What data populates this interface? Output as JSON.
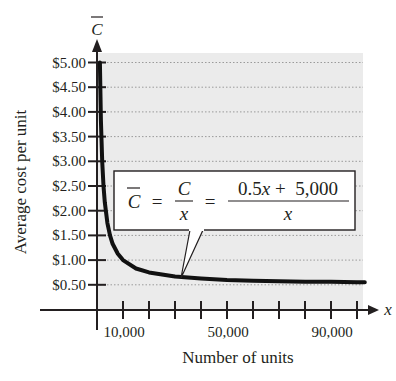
{
  "chart_data": {
    "type": "line",
    "title": "",
    "xlabel": "Number of units",
    "ylabel": "Average cost per unit",
    "x_axis_variable": "x",
    "y_axis_variable": "C̄",
    "xlim": [
      0,
      103000
    ],
    "ylim": [
      0,
      5.3
    ],
    "grid": {
      "horizontal_dotted": true,
      "vertical": false
    },
    "background_shading": "#ebebeb",
    "x_ticks": [
      10000,
      20000,
      30000,
      40000,
      50000,
      60000,
      70000,
      80000,
      90000,
      100000
    ],
    "x_tick_labels": [
      {
        "value": 10000,
        "label": "10,000"
      },
      {
        "value": 50000,
        "label": "50,000"
      },
      {
        "value": 90000,
        "label": "90,000"
      }
    ],
    "y_ticks": [
      {
        "value": 0.5,
        "label": "$0.50"
      },
      {
        "value": 1.0,
        "label": "$1.00"
      },
      {
        "value": 1.5,
        "label": "$1.50"
      },
      {
        "value": 2.0,
        "label": "$2.00"
      },
      {
        "value": 2.5,
        "label": "$2.50"
      },
      {
        "value": 3.0,
        "label": "$3.00"
      },
      {
        "value": 3.5,
        "label": "$3.50"
      },
      {
        "value": 4.0,
        "label": "$4.00"
      },
      {
        "value": 4.5,
        "label": "$4.50"
      },
      {
        "value": 5.0,
        "label": "$5.00"
      }
    ],
    "series": [
      {
        "name": "Average cost C̄ = 0.5 + 5000/x",
        "formula": "(0.5x + 5,000)/x",
        "x": [
          1111,
          1500,
          2000,
          2500,
          3000,
          4000,
          5000,
          6000,
          8000,
          10000,
          15000,
          20000,
          30000,
          40000,
          50000,
          60000,
          70000,
          80000,
          90000,
          100000,
          103000
        ],
        "values": [
          5.0,
          3.83,
          3.0,
          2.5,
          2.17,
          1.75,
          1.5,
          1.33,
          1.13,
          1.0,
          0.83,
          0.75,
          0.67,
          0.63,
          0.6,
          0.58,
          0.57,
          0.56,
          0.56,
          0.55,
          0.55
        ]
      }
    ],
    "annotations": [
      {
        "type": "callout",
        "text_parts": {
          "lhs": "C̄",
          "eq1": "=",
          "frac1_num": "C",
          "frac1_den": "x",
          "eq2": "=",
          "frac2_num": "0.5x + 5,000",
          "frac2_den": "x"
        },
        "points_to": {
          "x": 32000,
          "y": 0.66
        }
      }
    ]
  },
  "labels": {
    "y_var": "C",
    "x_var": "x",
    "ylabel": "Average cost per unit",
    "xlabel": "Number of units",
    "eq_lhs": "C",
    "eq_equals": "=",
    "frac1_num": "C",
    "frac1_den": "x",
    "frac2_num_a": "0.5",
    "frac2_num_x": "x",
    "frac2_num_b": " +  5,000",
    "frac2_den": "x"
  }
}
